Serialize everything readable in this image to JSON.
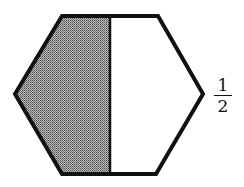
{
  "figure": {
    "shape": "hexagon",
    "parts": 2,
    "shaded_parts": 1,
    "shade_color": "#8a8a8a",
    "outline_color": "#111111"
  },
  "label": {
    "numerator": "1",
    "denominator": "2"
  }
}
